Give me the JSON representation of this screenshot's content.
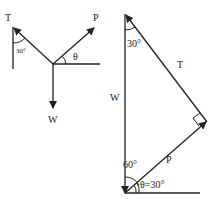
{
  "figure": {
    "left_diagram": {
      "labels": {
        "tension": "T",
        "pull": "P",
        "weight": "W",
        "angle_tension": "30°",
        "angle_pull": "θ"
      }
    },
    "right_diagram": {
      "labels": {
        "tension": "T",
        "pull": "P",
        "weight": "W",
        "angle_top": "30°",
        "angle_bottom": "60°",
        "angle_theta": "θ=30°"
      }
    },
    "colors": {
      "stroke": "#222222",
      "background": "#ffffff"
    }
  }
}
